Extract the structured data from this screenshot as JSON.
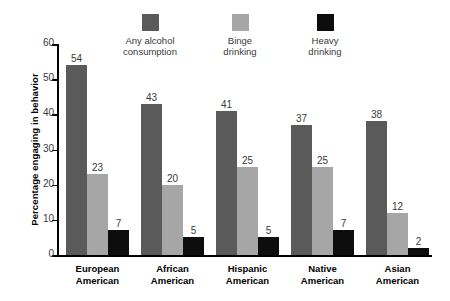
{
  "chart_data": {
    "type": "bar",
    "title": "",
    "xlabel": "",
    "ylabel": "Percentage engaging in behavior",
    "ylim": [
      0,
      60
    ],
    "yticks": [
      0,
      10,
      20,
      30,
      40,
      50,
      60
    ],
    "grid": false,
    "legend_position": "top",
    "categories": [
      "European American",
      "African American",
      "Hispanic American",
      "Native American",
      "Asian American"
    ],
    "category_lines": [
      [
        "European",
        "American"
      ],
      [
        "African",
        "American"
      ],
      [
        "Hispanic",
        "American"
      ],
      [
        "Native",
        "American"
      ],
      [
        "Asian",
        "American"
      ]
    ],
    "series": [
      {
        "name": "Any alcohol consumption",
        "name_lines": [
          "Any alcohol",
          "consumption"
        ],
        "color": "#5a5a5a",
        "values": [
          54,
          43,
          41,
          37,
          38
        ]
      },
      {
        "name": "Binge drinking",
        "name_lines": [
          "Binge",
          "drinking"
        ],
        "color": "#a6a6a6",
        "values": [
          23,
          20,
          25,
          25,
          12
        ]
      },
      {
        "name": "Heavy drinking",
        "name_lines": [
          "Heavy",
          "drinking"
        ],
        "color": "#0d0d0d",
        "values": [
          7,
          5,
          5,
          7,
          2
        ]
      }
    ]
  },
  "axis": {
    "y_title": "Percentage engaging in behavior",
    "tick_labels": [
      "0",
      "10",
      "20",
      "30",
      "40",
      "50",
      "60"
    ]
  },
  "legend": {
    "items": [
      {
        "label_line1": "Any alcohol",
        "label_line2": "consumption",
        "color": "#5a5a5a"
      },
      {
        "label_line1": "Binge",
        "label_line2": "drinking",
        "color": "#a6a6a6"
      },
      {
        "label_line1": "Heavy",
        "label_line2": "drinking",
        "color": "#0d0d0d"
      }
    ]
  },
  "bar_labels": {
    "g0": [
      "54",
      "23",
      "7"
    ],
    "g1": [
      "43",
      "20",
      "5"
    ],
    "g2": [
      "41",
      "25",
      "5"
    ],
    "g3": [
      "37",
      "25",
      "7"
    ],
    "g4": [
      "38",
      "12",
      "2"
    ]
  },
  "categories_text": {
    "c0a": "European",
    "c0b": "American",
    "c1a": "African",
    "c1b": "American",
    "c2a": "Hispanic",
    "c2b": "American",
    "c3a": "Native",
    "c3b": "American",
    "c4a": "Asian",
    "c4b": "American"
  }
}
